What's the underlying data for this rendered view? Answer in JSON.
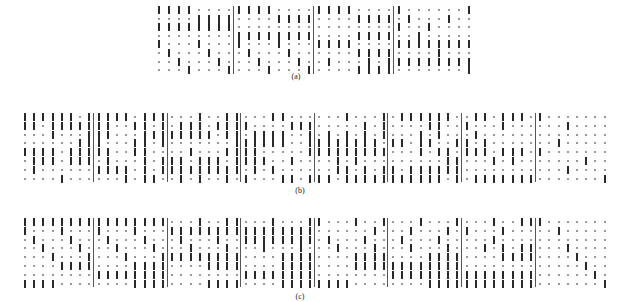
{
  "figure": {
    "panels": [
      {
        "id": "a",
        "caption": "(a)",
        "x": 158,
        "y": 6,
        "col_step": 10,
        "row_step": 8.6,
        "block_size": 8,
        "caption_x": 296,
        "caption_y": 72,
        "rows": [
          "11110000111100001111000010000001",
          "00001111000011110000111101000100",
          "11111111000000000000000010010000",
          "00000000111111110000111100100000",
          "10001000100010001111000011111111",
          "01000100010001000000111100001000",
          "00100010001000100100010111111111",
          "00010001000100010000111100000001"
        ]
      },
      {
        "id": "b",
        "caption": "(b)",
        "x": 24,
        "y": 113,
        "col_step": 9.2,
        "row_step": 8.8,
        "block_size": 8,
        "caption_x": 300,
        "caption_y": 186,
        "rows": [
          "1111110111110111000100110001100000010001011111100110111010000000",
          "1101111111001101011101111000011100000101000011001000100000010000",
          "0001000111000111111110110111100101010101000101000100000000000000",
          "0000001110001101000000011111100111111110110110011010000000100000",
          "1111011111001100001000111100000111111111000101101110111010000000",
          "0111011101000101110111011110010000101000000000110001010000000100",
          "0100000011110101111111110101000000110101101111110000000000010000",
          "0000100000010110010100101000110111011111111111010111111100000001"
        ]
      },
      {
        "id": "c",
        "caption": "(c)",
        "x": 24,
        "y": 218,
        "col_step": 9.2,
        "row_step": 8.8,
        "block_size": 8,
        "caption_x": 300,
        "caption_y": 292,
        "rows": [
          "1111111111111111000100110001000110001001000100010001001110000000",
          "1000100010001000111111111111111100000010001000101000100000100000",
          "0100010001000100010001001111111101000100010001000001000000000000",
          "0010001000100010001000100010001000100010001000100010101100010000",
          "0001000100010001111111110000111100001111000011110000111100001000",
          "0000111100001111000011110000111100001111111111110000000000000100",
          "0000000011111111000000001111111100000000111111111111111100000010",
          "1111000000001111000011110000111111110000000011111111111100000001"
        ]
      }
    ]
  }
}
